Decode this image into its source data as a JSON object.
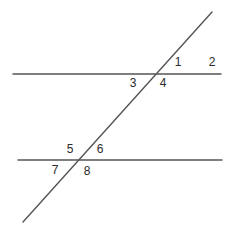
{
  "diagram": {
    "type": "parallel-lines-transversal",
    "line_color": "#555555",
    "label_color": "#2b2b2b",
    "lines": [
      {
        "name": "top-parallel-line",
        "x1": 13,
        "y1": 74,
        "x2": 221,
        "y2": 74
      },
      {
        "name": "bottom-parallel-line",
        "x1": 18,
        "y1": 160,
        "x2": 222,
        "y2": 160
      },
      {
        "name": "transversal-line",
        "x1": 212,
        "y1": 12,
        "x2": 23,
        "y2": 222
      }
    ],
    "angles": [
      {
        "label": "1",
        "x": 178,
        "y": 62
      },
      {
        "label": "2",
        "x": 212,
        "y": 62
      },
      {
        "label": "3",
        "x": 133,
        "y": 83
      },
      {
        "label": "4",
        "x": 163,
        "y": 83
      },
      {
        "label": "5",
        "x": 70,
        "y": 149
      },
      {
        "label": "6",
        "x": 100,
        "y": 149
      },
      {
        "label": "7",
        "x": 55,
        "y": 170
      },
      {
        "label": "8",
        "x": 87,
        "y": 171
      }
    ]
  }
}
